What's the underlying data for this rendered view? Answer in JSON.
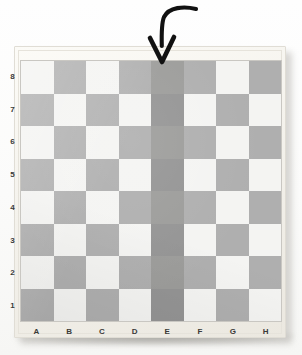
{
  "scene": {
    "subject": "chessboard-photograph",
    "background_color": "#fdfdfc"
  },
  "board": {
    "frame_color": "#f4f2ec",
    "light_square_color": "#f4f4f2",
    "dark_square_color": "#afafaf",
    "highlight_light_color": "#9c9c9a",
    "highlight_dark_color": "#949494",
    "files": [
      "A",
      "B",
      "C",
      "D",
      "E",
      "F",
      "G",
      "H"
    ],
    "ranks": [
      "8",
      "7",
      "6",
      "5",
      "4",
      "3",
      "2",
      "1"
    ],
    "highlighted_file": "E",
    "squares": [
      [
        "light",
        "dark",
        "light",
        "dark",
        "hl-light",
        "dark",
        "light",
        "dark"
      ],
      [
        "dark",
        "light",
        "dark",
        "light",
        "hl-dark",
        "light",
        "dark",
        "light"
      ],
      [
        "light",
        "dark",
        "light",
        "dark",
        "hl-light",
        "dark",
        "light",
        "dark"
      ],
      [
        "dark",
        "light",
        "dark",
        "light",
        "hl-dark",
        "light",
        "dark",
        "light"
      ],
      [
        "light",
        "dark",
        "light",
        "dark",
        "hl-light",
        "dark",
        "light",
        "dark"
      ],
      [
        "dark",
        "light",
        "dark",
        "light",
        "hl-dark",
        "light",
        "dark",
        "light"
      ],
      [
        "light",
        "dark",
        "light",
        "dark",
        "hl-light",
        "dark",
        "light",
        "dark"
      ],
      [
        "dark",
        "light",
        "dark",
        "light",
        "hl-dark",
        "light",
        "dark",
        "light"
      ]
    ]
  },
  "annotation": {
    "type": "curved-down-arrow",
    "color": "#111111",
    "points_at_file": "E",
    "points_at_square": "E8"
  }
}
